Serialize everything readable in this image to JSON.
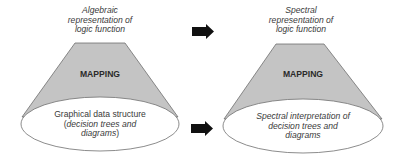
{
  "colors": {
    "cone_fill": "#c4c4c4",
    "outline": "#6e6e6e",
    "arrow": "#111111",
    "ellipse_fill": "#ffffff"
  },
  "left_cone": {
    "top_label_lines": [
      "Algebraic",
      "representation of",
      "logic function"
    ],
    "mapping_label": "MAPPING",
    "base_label": {
      "line1": "Graphical data structure",
      "line2_prefix": "(",
      "line2_italic": "decision trees and",
      "line3_italic": "diagrams",
      "line3_suffix": ")"
    }
  },
  "right_cone": {
    "top_label_lines": [
      "Spectral",
      "representation of",
      "logic function"
    ],
    "mapping_label": "MAPPING",
    "base_label_lines": [
      "Spectral interpretation of",
      "decision trees and",
      "diagrams"
    ]
  },
  "arrows": [
    {
      "name": "top-arrow",
      "direction": "right"
    },
    {
      "name": "bottom-arrow",
      "direction": "right"
    }
  ]
}
